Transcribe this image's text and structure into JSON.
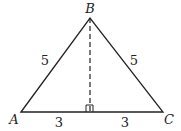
{
  "diagram": {
    "type": "isosceles-triangle",
    "vertices": [
      {
        "id": "A",
        "label": "A"
      },
      {
        "id": "B",
        "label": "B"
      },
      {
        "id": "C",
        "label": "C"
      }
    ],
    "sides": {
      "AB": "5",
      "BC": "5",
      "left_base_segment": "3",
      "right_base_segment": "3"
    },
    "altitude": {
      "from": "B",
      "style": "dashed",
      "right_angle_marker": true
    }
  }
}
